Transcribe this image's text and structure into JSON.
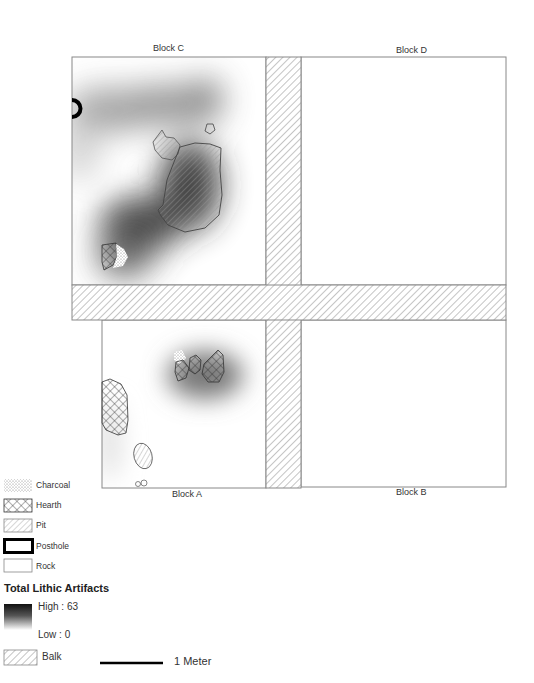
{
  "map": {
    "blocks": [
      {
        "id": "C",
        "label": "Block C"
      },
      {
        "id": "D",
        "label": "Block D"
      },
      {
        "id": "A",
        "label": "Block A"
      },
      {
        "id": "B",
        "label": "Block B"
      }
    ],
    "features": {
      "block_c": [
        "posthole",
        "rock",
        "pit",
        "pit",
        "hearth",
        "charcoal"
      ],
      "block_a": [
        "charcoal",
        "hearth",
        "hearth",
        "hearth",
        "hearth",
        "pit",
        "rock",
        "rock"
      ]
    }
  },
  "legend": {
    "items": [
      {
        "key": "charcoal",
        "label": "Charcoal"
      },
      {
        "key": "hearth",
        "label": "Hearth"
      },
      {
        "key": "pit",
        "label": "Pit"
      },
      {
        "key": "posthole",
        "label": "Posthole"
      },
      {
        "key": "rock",
        "label": "Rock"
      }
    ],
    "density_title": "Total Lithic Artifacts",
    "high_label": "High : 63",
    "low_label": "Low : 0",
    "balk_label": "Balk",
    "scale_label": "1 Meter"
  },
  "colors": {
    "outline": "#888888",
    "hatch": "#9a9a9a",
    "density_high": "#111111",
    "density_low": "#ffffff"
  }
}
